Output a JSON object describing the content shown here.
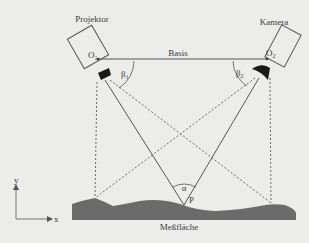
{
  "diagram": {
    "type": "triangulation-setup",
    "projector": {
      "label": "Projektor",
      "origin_label": "O",
      "origin_sub": "1",
      "angle_label": "β",
      "angle_sub": "1"
    },
    "camera": {
      "label": "Kamera",
      "origin_label": "O",
      "origin_sub": "2",
      "angle_label": "β",
      "angle_sub": "2"
    },
    "baseline_label": "Basis",
    "point_label": "P",
    "triangulation_angle_label": "α",
    "surface_label": "Meßfläche",
    "axes": {
      "x_label": "x",
      "y_label": "y"
    },
    "colors": {
      "background": "#ececea",
      "line": "#555555",
      "surface": "#6b6b6b",
      "lens": "#1a1a1a",
      "text": "#3a3a3a"
    }
  }
}
